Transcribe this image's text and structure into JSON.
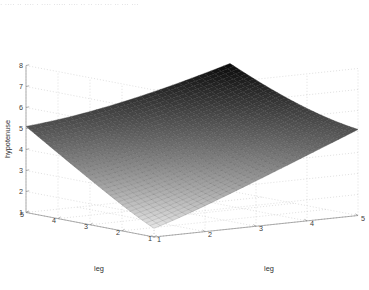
{
  "window": {
    "top_strip_text": "·  ···· ·· ····  ·  ···· ····· ···· ·· ·· ···  ··· ·· ··· ···"
  },
  "figure": {
    "background": "#ffffff",
    "axis_color": "#8d8d8d",
    "grid_color": "#c9c9c9",
    "tick_text_color": "#3b3b3b"
  },
  "chart_data": {
    "type": "surface",
    "title": "",
    "xlabel": "leg",
    "ylabel": "leg",
    "zlabel": "hypotenuse",
    "colormap": "gray",
    "shading": "dark-high",
    "grid": true,
    "legend": null,
    "view": {
      "azimuth": -37.5,
      "elevation": 30
    },
    "x": [
      1,
      2,
      3,
      4,
      5
    ],
    "y": [
      1,
      2,
      3,
      4,
      5
    ],
    "xlim": [
      1,
      5
    ],
    "ylim": [
      1,
      5
    ],
    "zlim": [
      1,
      8
    ],
    "xticks": [
      "1",
      "2",
      "3",
      "4",
      "5"
    ],
    "yticks": [
      "1",
      "2",
      "3",
      "4",
      "5"
    ],
    "zticks": [
      "1",
      "2",
      "3",
      "4",
      "5",
      "6",
      "7",
      "8"
    ],
    "mesh_divisions": 32,
    "function": "hypotenuse = sqrt(leg_x^2 + leg_y^2)",
    "z_corner_values": {
      "x1_y1": 1.41,
      "x5_y1": 5.1,
      "x1_y5": 5.1,
      "x5_y5": 7.07
    },
    "z_grid": [
      [
        1.41,
        2.24,
        3.16,
        4.12,
        5.1
      ],
      [
        2.24,
        2.83,
        3.61,
        4.47,
        5.39
      ],
      [
        3.16,
        3.61,
        4.24,
        5.0,
        5.83
      ],
      [
        4.12,
        4.47,
        5.0,
        5.66,
        6.4
      ],
      [
        5.1,
        5.39,
        5.83,
        6.4,
        7.07
      ]
    ]
  }
}
